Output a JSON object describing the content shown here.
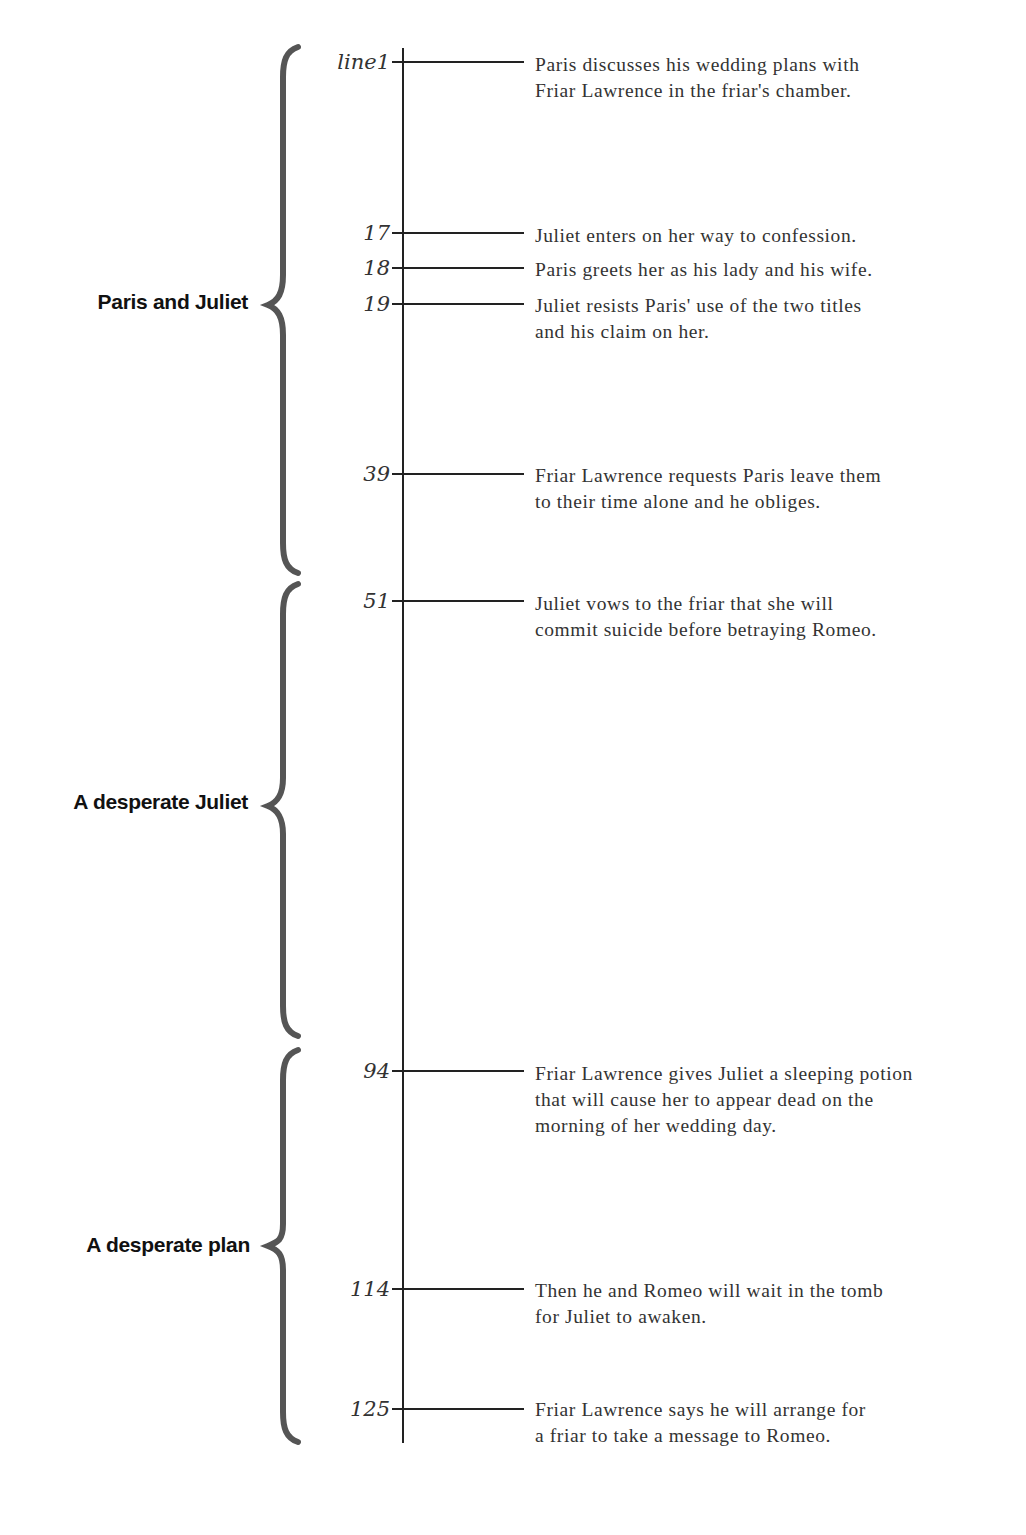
{
  "timeline": {
    "events": [
      {
        "line": "line1",
        "text": "Paris discusses his wedding plans with\nFriar Lawrence in the friar's chamber."
      },
      {
        "line": "17",
        "text": "Juliet enters on her way to confession."
      },
      {
        "line": "18",
        "text": "Paris greets her as his lady and his wife."
      },
      {
        "line": "19",
        "text": "Juliet resists Paris' use of the two titles\nand his claim on her."
      },
      {
        "line": "39",
        "text": "Friar Lawrence requests Paris leave them\nto their time alone and he obliges."
      },
      {
        "line": "51",
        "text": "Juliet vows to the friar that she will\ncommit suicide before betraying Romeo."
      },
      {
        "line": "94",
        "text": "Friar Lawrence gives Juliet a sleeping potion\nthat will cause her to appear dead on the\nmorning of her wedding day."
      },
      {
        "line": "114",
        "text": "Then he and Romeo will wait in the tomb\nfor Juliet to awaken."
      },
      {
        "line": "125",
        "text": "Friar Lawrence says he will arrange for\na friar to take a message to Romeo."
      }
    ],
    "sections": [
      {
        "label": "Paris and Juliet",
        "lines": "1–50"
      },
      {
        "label": "A desperate Juliet",
        "lines": "51–93"
      },
      {
        "label": "A desperate plan",
        "lines": "94–125"
      }
    ]
  },
  "colors": {
    "brace": "#555555",
    "axis": "#222222",
    "text": "#333333"
  }
}
